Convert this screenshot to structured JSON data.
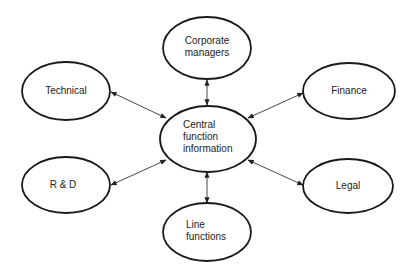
{
  "diagram": {
    "type": "hub-and-spoke",
    "hub": {
      "id": "central",
      "lines": [
        "Central",
        "function",
        "information"
      ],
      "cx": 208,
      "cy": 139,
      "rx": 48,
      "ry": 33,
      "text_x": 183,
      "text_y0": 128
    },
    "nodes": [
      {
        "id": "corporate-managers",
        "lines": [
          "Corporate",
          "managers"
        ],
        "cx": 207,
        "cy": 48,
        "rx": 44,
        "ry": 31,
        "text_anchor": "middle",
        "text_x": 207,
        "text_y0": 44
      },
      {
        "id": "technical",
        "lines": [
          "Technical"
        ],
        "cx": 66,
        "cy": 91,
        "rx": 44,
        "ry": 29,
        "text_anchor": "middle",
        "text_x": 66,
        "text_y0": 94
      },
      {
        "id": "finance",
        "lines": [
          "Finance"
        ],
        "cx": 349,
        "cy": 91,
        "rx": 46,
        "ry": 28,
        "text_anchor": "middle",
        "text_x": 349,
        "text_y0": 94
      },
      {
        "id": "r-and-d",
        "lines": [
          "R & D"
        ],
        "cx": 66,
        "cy": 185,
        "rx": 44,
        "ry": 28,
        "text_anchor": "middle",
        "text_x": 63,
        "text_y0": 188
      },
      {
        "id": "legal",
        "lines": [
          "Legal"
        ],
        "cx": 348,
        "cy": 186,
        "rx": 45,
        "ry": 27,
        "text_anchor": "middle",
        "text_x": 348,
        "text_y0": 189
      },
      {
        "id": "line-functions",
        "lines": [
          "Line",
          "functions"
        ],
        "cx": 207,
        "cy": 232,
        "rx": 44,
        "ry": 29,
        "text_anchor": "start",
        "text_x": 186,
        "text_y0": 228
      }
    ],
    "edges": [
      {
        "from": "central",
        "to": "corporate-managers",
        "x1": 207,
        "y1": 105,
        "x2": 207,
        "y2": 80,
        "bidirectional": true
      },
      {
        "from": "central",
        "to": "technical",
        "x1": 166,
        "y1": 118,
        "x2": 111,
        "y2": 92,
        "bidirectional": true
      },
      {
        "from": "central",
        "to": "finance",
        "x1": 248,
        "y1": 118,
        "x2": 303,
        "y2": 93,
        "bidirectional": true
      },
      {
        "from": "central",
        "to": "r-and-d",
        "x1": 166,
        "y1": 160,
        "x2": 111,
        "y2": 185,
        "bidirectional": true
      },
      {
        "from": "central",
        "to": "legal",
        "x1": 248,
        "y1": 160,
        "x2": 303,
        "y2": 185,
        "bidirectional": true
      },
      {
        "from": "central",
        "to": "line-functions",
        "x1": 207,
        "y1": 172,
        "x2": 207,
        "y2": 203,
        "bidirectional": true
      }
    ]
  }
}
